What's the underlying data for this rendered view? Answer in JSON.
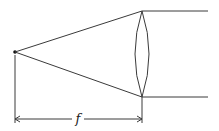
{
  "diagram": {
    "title": "",
    "focal_length_label": "f",
    "elements": [
      "focal-point",
      "ray-upper",
      "ray-lower",
      "convex-lens",
      "parallel-ray-upper",
      "parallel-ray-lower",
      "focal-length-dimension"
    ]
  }
}
